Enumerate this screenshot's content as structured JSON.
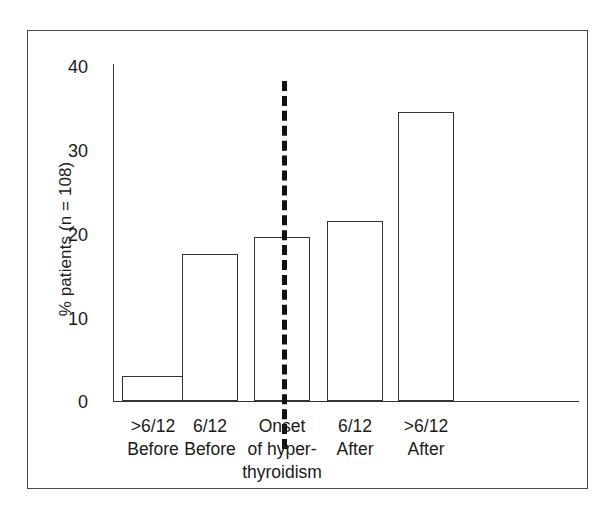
{
  "chart_data": {
    "type": "bar",
    "title": "",
    "subtitle": "",
    "xlabel": "",
    "ylabel": "% patients (n = 108)",
    "categories": [
      ">6/12\nBefore",
      "6/12\nBefore",
      "Onset\nof hyper-\nthyroidism",
      "6/12\nAfter",
      ">6/12\nAfter"
    ],
    "values": [
      3.0,
      17.4,
      19.5,
      21.4,
      34.3
    ],
    "ylim": [
      0,
      40
    ],
    "ytick_labels": [
      "0",
      "10",
      "20",
      "30",
      "40"
    ],
    "ytick_values": [
      0,
      10,
      20,
      30,
      40
    ],
    "grid": false,
    "legend": null,
    "bar_style": {
      "fill": "#ffffff",
      "edge": "#333333"
    },
    "annotations": [
      {
        "name": "onset-divider",
        "type": "vertical-dashed-line",
        "at_category_index": 2,
        "color": "#111111",
        "label": ""
      }
    ]
  },
  "figure": {
    "frame_color": "#4a4a4a",
    "background": "#ffffff",
    "axis_color": "#333333"
  }
}
